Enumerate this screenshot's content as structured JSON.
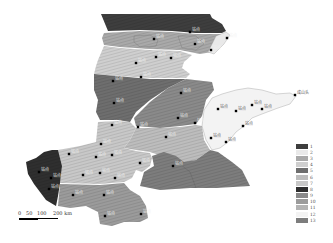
{
  "map": {
    "description": "Grayscale zoning map, 13 hatched zones",
    "regions": [
      {
        "zone": 1,
        "color": "#3e3e3e"
      },
      {
        "zone": 2,
        "color": "#e9e9e9"
      },
      {
        "zone": 3,
        "color": "#a9a9a9"
      },
      {
        "zone": 4,
        "color": "#cfcfcf"
      },
      {
        "zone": 5,
        "color": "#6e6e6e"
      },
      {
        "zone": 6,
        "color": "#bdbdbd"
      },
      {
        "zone": 7,
        "color": "#c8c8c8"
      },
      {
        "zone": 8,
        "color": "#2f2f2f"
      },
      {
        "zone": 9,
        "color": "#8a8a8a"
      },
      {
        "zone": 10,
        "color": "#9b9b9b"
      },
      {
        "zone": 11,
        "color": "#b3b3b3"
      },
      {
        "zone": 12,
        "color": "#f3f3f3"
      },
      {
        "zone": 13,
        "color": "#7d7d7d"
      }
    ],
    "stations": [
      {
        "name": "站点",
        "x": 190,
        "y": 32
      },
      {
        "name": "站点",
        "x": 154,
        "y": 39
      },
      {
        "name": "站点",
        "x": 195,
        "y": 44
      },
      {
        "name": "站点",
        "x": 227,
        "y": 38
      },
      {
        "name": "站点",
        "x": 211,
        "y": 50
      },
      {
        "name": "站点",
        "x": 156,
        "y": 57
      },
      {
        "name": "站点",
        "x": 171,
        "y": 58
      },
      {
        "name": "站点",
        "x": 136,
        "y": 63
      },
      {
        "name": "站点",
        "x": 141,
        "y": 77
      },
      {
        "name": "站点",
        "x": 113,
        "y": 81
      },
      {
        "name": "站点",
        "x": 181,
        "y": 93
      },
      {
        "name": "站点",
        "x": 114,
        "y": 103
      },
      {
        "name": "站点",
        "x": 178,
        "y": 118
      },
      {
        "name": "站点",
        "x": 195,
        "y": 123
      },
      {
        "name": "站点",
        "x": 112,
        "y": 125
      },
      {
        "name": "站点",
        "x": 138,
        "y": 127
      },
      {
        "name": "站点",
        "x": 166,
        "y": 137
      },
      {
        "name": "站点",
        "x": 218,
        "y": 109
      },
      {
        "name": "站点",
        "x": 236,
        "y": 111
      },
      {
        "name": "站点",
        "x": 252,
        "y": 105
      },
      {
        "name": "站点",
        "x": 262,
        "y": 109
      },
      {
        "name": "成山头",
        "x": 295,
        "y": 95
      },
      {
        "name": "站点",
        "x": 243,
        "y": 126
      },
      {
        "name": "站点",
        "x": 211,
        "y": 138
      },
      {
        "name": "站点",
        "x": 226,
        "y": 142
      },
      {
        "name": "站点",
        "x": 101,
        "y": 144
      },
      {
        "name": "站点",
        "x": 69,
        "y": 154
      },
      {
        "name": "站点",
        "x": 96,
        "y": 157
      },
      {
        "name": "站点",
        "x": 112,
        "y": 155
      },
      {
        "name": "站点",
        "x": 140,
        "y": 163
      },
      {
        "name": "站点",
        "x": 173,
        "y": 166
      },
      {
        "name": "站点",
        "x": 39,
        "y": 172
      },
      {
        "name": "站点",
        "x": 51,
        "y": 178
      },
      {
        "name": "站点",
        "x": 83,
        "y": 175
      },
      {
        "name": "站点",
        "x": 100,
        "y": 173
      },
      {
        "name": "站点",
        "x": 115,
        "y": 178
      },
      {
        "name": "站点",
        "x": 49,
        "y": 189
      },
      {
        "name": "站点",
        "x": 73,
        "y": 195
      },
      {
        "name": "站点",
        "x": 104,
        "y": 195
      },
      {
        "name": "站点",
        "x": 105,
        "y": 216
      },
      {
        "name": "站点",
        "x": 141,
        "y": 214
      }
    ]
  },
  "legend": {
    "items": [
      {
        "label": "1",
        "color": "#3e3e3e"
      },
      {
        "label": "2",
        "color": "#e9e9e9"
      },
      {
        "label": "3",
        "color": "#a9a9a9"
      },
      {
        "label": "4",
        "color": "#cfcfcf"
      },
      {
        "label": "5",
        "color": "#6e6e6e"
      },
      {
        "label": "6",
        "color": "#bdbdbd"
      },
      {
        "label": "7",
        "color": "#c8c8c8"
      },
      {
        "label": "8",
        "color": "#2f2f2f"
      },
      {
        "label": "9",
        "color": "#8a8a8a"
      },
      {
        "label": "10",
        "color": "#9b9b9b"
      },
      {
        "label": "11",
        "color": "#b3b3b3"
      },
      {
        "label": "12",
        "color": "#f3f3f3"
      },
      {
        "label": "13",
        "color": "#7d7d7d"
      }
    ]
  },
  "scale_bar": {
    "ticks": [
      "0",
      "50",
      "100",
      "200 km"
    ]
  }
}
